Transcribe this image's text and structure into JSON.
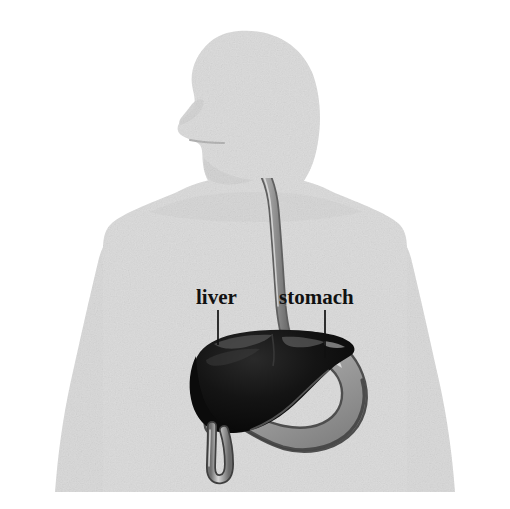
{
  "illustration": {
    "title": "Human torso silhouette with digestive organs",
    "background_color": "#ffffff",
    "body_color": "#dcdcdc",
    "body_shade_color": "#cfcfcf",
    "labels": [
      {
        "id": "liver",
        "text": "liver",
        "text_x": 196,
        "text_y": 304,
        "leader_x": 218,
        "leader_y_start": 310,
        "leader_y_end": 345,
        "color": "#111111"
      },
      {
        "id": "stomach",
        "text": "stomach",
        "text_x": 279,
        "text_y": 304,
        "leader_x": 325,
        "leader_y_start": 310,
        "leader_y_end": 358,
        "color": "#111111"
      }
    ],
    "organs": [
      {
        "id": "liver",
        "name": "liver",
        "fill_color": "#0d0d0d",
        "highlight_color": "#5a5a5a",
        "description": "large dark lobed organ on the left of the abdomen"
      },
      {
        "id": "stomach",
        "name": "stomach",
        "fill_color": "#9a9a9a",
        "highlight_color": "#e2e2e2",
        "outline_color": "#4a4a4a",
        "description": "mid-gray J-shaped sac to the right, partly behind the liver"
      },
      {
        "id": "esophagus",
        "name": "esophagus",
        "fill_color": "#c8c8c8",
        "outline_color": "#6e6e6e",
        "description": "tube running from the mouth down the chest to the stomach"
      },
      {
        "id": "duodenum",
        "name": "duodenum",
        "fill_color": "#c9c9c9",
        "outline_color": "#4a4a4a",
        "description": "short tube descending from beneath the liver"
      }
    ],
    "body_parts": [
      {
        "id": "head",
        "name": "head-profile-facing-left"
      },
      {
        "id": "neck",
        "name": "neck"
      },
      {
        "id": "torso",
        "name": "torso"
      },
      {
        "id": "arm-left",
        "name": "left-arm"
      },
      {
        "id": "arm-right",
        "name": "right-arm"
      }
    ]
  }
}
